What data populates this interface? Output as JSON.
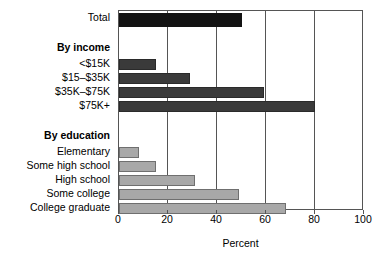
{
  "chart_data": {
    "type": "bar",
    "orientation": "horizontal",
    "title": "",
    "subtitle": "",
    "xlabel": "Percent",
    "ylabel": "",
    "xlim": [
      0,
      100
    ],
    "xticks": [
      0,
      20,
      40,
      60,
      80,
      100
    ],
    "xtick_labels": [
      "0",
      "20",
      "40",
      "60",
      "80",
      "100"
    ],
    "grid": "vertical",
    "legend": "none",
    "categories": [
      "Total",
      "<$15K",
      "$15–$35K",
      "$35K–$75K",
      "$75K+",
      "Elementary",
      "Some high school",
      "High school",
      "Some college",
      "College graduate"
    ],
    "values": [
      50,
      15,
      29,
      59,
      80,
      8,
      15,
      31,
      49,
      68
    ],
    "group_headings": [
      "By income",
      "By education"
    ],
    "rows": [
      {
        "label": "Total",
        "value": 50,
        "kind": "bar",
        "style": "total",
        "top": 4,
        "height": 14
      },
      {
        "label": "By income",
        "value": null,
        "kind": "header",
        "style": "header",
        "top": 34,
        "height": 12
      },
      {
        "label": "<$15K",
        "value": 15,
        "kind": "bar",
        "style": "income",
        "top": 50,
        "height": 11
      },
      {
        "label": "$15–$35K",
        "value": 29,
        "kind": "bar",
        "style": "income",
        "top": 64,
        "height": 11
      },
      {
        "label": "$35K–$75K",
        "value": 59,
        "kind": "bar",
        "style": "income",
        "top": 78,
        "height": 11
      },
      {
        "label": "$75K+",
        "value": 80,
        "kind": "bar",
        "style": "income",
        "top": 92,
        "height": 11
      },
      {
        "label": "By education",
        "value": null,
        "kind": "header",
        "style": "header",
        "top": 122,
        "height": 12
      },
      {
        "label": "Elementary",
        "value": 8,
        "kind": "bar",
        "style": "edu",
        "top": 138,
        "height": 11
      },
      {
        "label": "Some high school",
        "value": 15,
        "kind": "bar",
        "style": "edu",
        "top": 152,
        "height": 11
      },
      {
        "label": "High school",
        "value": 31,
        "kind": "bar",
        "style": "edu",
        "top": 166,
        "height": 11
      },
      {
        "label": "Some college",
        "value": 49,
        "kind": "bar",
        "style": "edu",
        "top": 180,
        "height": 11
      },
      {
        "label": "College graduate",
        "value": 68,
        "kind": "bar",
        "style": "edu",
        "top": 194,
        "height": 11
      }
    ],
    "colors": {
      "total_bar": "#131313",
      "income_bar": "#3a3a3a",
      "education_bar": "#a8a8a8",
      "axis": "#555555",
      "background": "#ffffff",
      "text": "#000000"
    }
  }
}
